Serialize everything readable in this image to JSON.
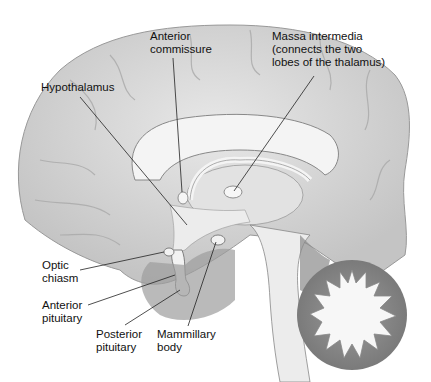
{
  "diagram": {
    "labels": [
      {
        "id": "anterior-commissure",
        "text": "Anterior\ncommissure",
        "x": 150,
        "y": 30
      },
      {
        "id": "massa-intermedia",
        "text": "Massa intermedia\n(connects the two\nlobes of the thalamus)",
        "x": 272,
        "y": 30
      },
      {
        "id": "hypothalamus",
        "text": "Hypothalamus",
        "x": 41,
        "y": 81
      },
      {
        "id": "optic-chiasm",
        "text": "Optic\nchiasm",
        "x": 42,
        "y": 259
      },
      {
        "id": "anterior-pituitary",
        "text": "Anterior\npituitary",
        "x": 42,
        "y": 299
      },
      {
        "id": "posterior-pituitary",
        "text": "Posterior\npituitary",
        "x": 96,
        "y": 328
      },
      {
        "id": "mammillary-body",
        "text": "Mammillary\nbody",
        "x": 157,
        "y": 328
      }
    ],
    "colors": {
      "cortex": "#dcdcdc",
      "cortex_shadow": "#b8b8b8",
      "white_matter": "#f2f2f2",
      "brainstem": "#e6e6e6",
      "dark_tissue": "#8c8c8c",
      "line": "#222222"
    }
  }
}
